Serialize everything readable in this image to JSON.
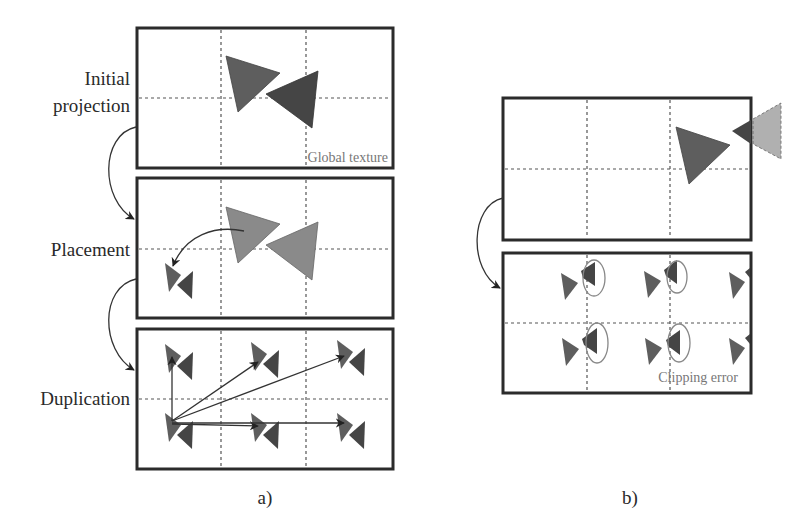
{
  "figure": {
    "panel_a": {
      "caption": "a)",
      "steps": [
        {
          "label_line1": "Initial",
          "label_line2": "projection",
          "note": "Global texture"
        },
        {
          "label": "Placement"
        },
        {
          "label": "Duplication"
        }
      ]
    },
    "panel_b": {
      "caption": "b)",
      "note": "Clipping error"
    },
    "colors": {
      "triangle_medium": "#5e5e5e",
      "triangle_dark": "#454545",
      "triangle_light": "#8a8a8a",
      "triangle_clipped": "#b0b0b0",
      "frame": "#2b2b2b",
      "note_text": "#777777"
    }
  }
}
